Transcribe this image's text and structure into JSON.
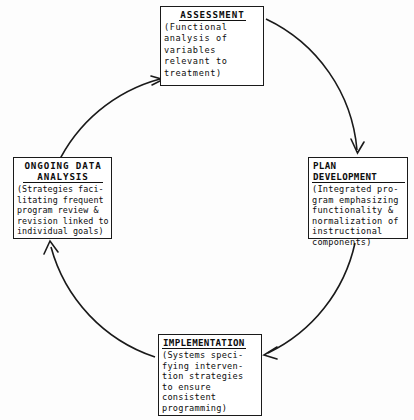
{
  "diagram": {
    "type": "cycle",
    "direction": "clockwise",
    "stroke_color": "#1a1a1a",
    "background_color": "#fdfdfd",
    "circle": {
      "center_x": 207,
      "center_y": 237,
      "radius": 160
    },
    "nodes": [
      {
        "id": "assessment",
        "title": "ASSESSMENT",
        "body": "(Functional\nanalysis of\nvariables\nrelevant to\ntreatment)",
        "position": "top"
      },
      {
        "id": "plan_development",
        "title": "PLAN DEVELOPMENT",
        "body": "(Integrated pro-\ngram emphasizing\nfunctionality &\nnormalization of\ninstructional\ncomponents)",
        "position": "right"
      },
      {
        "id": "implementation",
        "title": "IMPLEMENTATION",
        "body": "(Systems speci-\nfying interven-\ntion strategies\nto ensure\nconsistent\nprogramming)",
        "position": "bottom"
      },
      {
        "id": "ongoing_data_analysis",
        "title": "ONGOING DATA\nANALYSIS",
        "body": "(Strategies faci-\nlitating frequent\nprogram review &\nrevision linked to\nindividual goals)",
        "position": "left"
      }
    ],
    "edges": [
      {
        "from": "ongoing_data_analysis",
        "to": "assessment",
        "arrowhead": true
      },
      {
        "from": "assessment",
        "to": "plan_development",
        "arrowhead": true
      },
      {
        "from": "plan_development",
        "to": "implementation",
        "arrowhead": true
      },
      {
        "from": "implementation",
        "to": "ongoing_data_analysis",
        "arrowhead": true
      }
    ]
  }
}
